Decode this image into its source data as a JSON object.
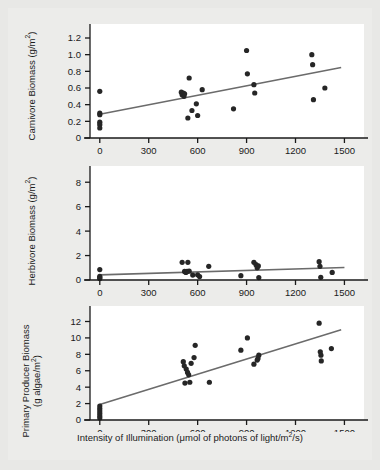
{
  "figure": {
    "background_color": "#ececea",
    "plot_background_color": "#ffffff",
    "point_color": "#262626",
    "line_color": "#6b6b6b",
    "axis_color": "#1a1a1a",
    "xlabel_prefix": "Intensity of Illumination (μmol of photons of light/m",
    "xlabel_exponent": "2",
    "xlabel_suffix": "/s)"
  },
  "chart_data": [
    {
      "type": "scatter",
      "panel": 1,
      "title": "",
      "xlabel": "",
      "ylabel": "Carnivore Biomass (g/m²)",
      "ylabel_main": "Carnivore Biomass (g/m",
      "ylabel_exponent": "2",
      "ylabel_tail": ")",
      "xlim": [
        -60,
        1620
      ],
      "ylim": [
        0,
        1.32
      ],
      "xticks": [
        0,
        300,
        600,
        900,
        1200,
        1500
      ],
      "xticklabels": [
        "0",
        "300",
        "600",
        "900",
        "1200",
        "1500"
      ],
      "yticks": [
        0,
        0.2,
        0.4,
        0.6,
        0.8,
        1.0,
        1.2
      ],
      "yticklabels": [
        "0",
        "0.2",
        "0.4",
        "0.6",
        "0.8",
        "1.0",
        "1.2"
      ],
      "grid": false,
      "legend": false,
      "points": [
        [
          0,
          0.56
        ],
        [
          0,
          0.3
        ],
        [
          0,
          0.28
        ],
        [
          0,
          0.19
        ],
        [
          0,
          0.16
        ],
        [
          0,
          0.12
        ],
        [
          500,
          0.55
        ],
        [
          505,
          0.52
        ],
        [
          512,
          0.54
        ],
        [
          516,
          0.5
        ],
        [
          520,
          0.53
        ],
        [
          540,
          0.24
        ],
        [
          548,
          0.72
        ],
        [
          565,
          0.33
        ],
        [
          592,
          0.41
        ],
        [
          600,
          0.27
        ],
        [
          628,
          0.58
        ],
        [
          820,
          0.35
        ],
        [
          900,
          1.05
        ],
        [
          905,
          0.77
        ],
        [
          945,
          0.64
        ],
        [
          950,
          0.54
        ],
        [
          1300,
          1.0
        ],
        [
          1305,
          0.88
        ],
        [
          1310,
          0.46
        ],
        [
          1380,
          0.6
        ]
      ],
      "trendline": {
        "x": [
          0,
          1480
        ],
        "y": [
          0.285,
          0.845
        ]
      }
    },
    {
      "type": "scatter",
      "panel": 2,
      "title": "",
      "xlabel": "",
      "ylabel": "Herbivore Biomass (g/m²)",
      "ylabel_main": "Herbivore Biomass (g/m",
      "ylabel_exponent": "2",
      "ylabel_tail": ")",
      "xlim": [
        -60,
        1620
      ],
      "ylim": [
        0,
        9.0
      ],
      "xticks": [
        0,
        300,
        600,
        900,
        1200,
        1500
      ],
      "xticklabels": [
        "0",
        "300",
        "600",
        "900",
        "1200",
        "1500"
      ],
      "yticks": [
        0,
        2,
        4,
        6,
        8
      ],
      "yticklabels": [
        "0",
        "2",
        "4",
        "6",
        "8"
      ],
      "grid": false,
      "legend": false,
      "points": [
        [
          0,
          0.85
        ],
        [
          0,
          0.3
        ],
        [
          0,
          0.2
        ],
        [
          0,
          0.12
        ],
        [
          505,
          1.45
        ],
        [
          520,
          0.7
        ],
        [
          528,
          0.62
        ],
        [
          535,
          0.7
        ],
        [
          540,
          1.45
        ],
        [
          548,
          0.72
        ],
        [
          570,
          0.4
        ],
        [
          600,
          0.42
        ],
        [
          612,
          0.28
        ],
        [
          668,
          1.12
        ],
        [
          865,
          0.35
        ],
        [
          945,
          1.45
        ],
        [
          958,
          1.25
        ],
        [
          965,
          1.0
        ],
        [
          972,
          1.15
        ],
        [
          975,
          0.2
        ],
        [
          1345,
          1.5
        ],
        [
          1350,
          1.12
        ],
        [
          1355,
          0.22
        ],
        [
          1425,
          0.62
        ]
      ],
      "trendline": {
        "x": [
          0,
          1500
        ],
        "y": [
          0.42,
          1.02
        ]
      }
    },
    {
      "type": "scatter",
      "panel": 3,
      "title": "",
      "xlabel": "Intensity of Illumination (μmol of photons of light/m²/s)",
      "ylabel": "Primary Producer Biomass (g algae/m²)",
      "ylabel_main": "Primary Producer Biomass",
      "ylabel_sub_main": "(g algae/m",
      "ylabel_exponent": "2",
      "ylabel_tail": ")",
      "xlim": [
        -60,
        1620
      ],
      "ylim": [
        0,
        13.4
      ],
      "xticks": [
        0,
        300,
        600,
        900,
        1200,
        1500
      ],
      "xticklabels": [
        "0",
        "300",
        "600",
        "900",
        "1200",
        "1500"
      ],
      "yticks": [
        0,
        2,
        4,
        6,
        8,
        10,
        12
      ],
      "yticklabels": [
        "0",
        "2",
        "4",
        "6",
        "8",
        "10",
        "12"
      ],
      "grid": false,
      "legend": false,
      "points": [
        [
          0,
          1.7
        ],
        [
          0,
          1.4
        ],
        [
          0,
          1.1
        ],
        [
          0,
          0.8
        ],
        [
          0,
          0.5
        ],
        [
          0,
          0.25
        ],
        [
          512,
          7.1
        ],
        [
          518,
          6.6
        ],
        [
          522,
          4.5
        ],
        [
          530,
          6.2
        ],
        [
          538,
          5.8
        ],
        [
          545,
          5.5
        ],
        [
          552,
          4.6
        ],
        [
          560,
          6.9
        ],
        [
          578,
          7.6
        ],
        [
          585,
          9.1
        ],
        [
          672,
          4.6
        ],
        [
          865,
          8.5
        ],
        [
          905,
          10.0
        ],
        [
          945,
          6.8
        ],
        [
          965,
          7.3
        ],
        [
          970,
          7.5
        ],
        [
          975,
          7.9
        ],
        [
          1345,
          11.8
        ],
        [
          1352,
          8.3
        ],
        [
          1356,
          7.9
        ],
        [
          1358,
          7.2
        ],
        [
          1420,
          8.7
        ]
      ],
      "trendline": {
        "x": [
          0,
          1480
        ],
        "y": [
          1.9,
          11.0
        ]
      }
    }
  ]
}
